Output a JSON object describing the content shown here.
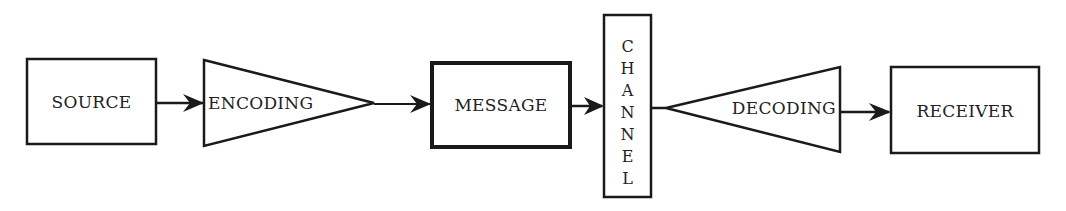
{
  "diagram": {
    "type": "communication-process-flow",
    "colors": {
      "background": "#ffffff",
      "line": "#1a1a1a",
      "text": "#222222"
    },
    "nodes": [
      {
        "id": "source",
        "label": "SOURCE",
        "shape": "rectangle"
      },
      {
        "id": "encoding",
        "label": "ENCODING",
        "shape": "triangle-right"
      },
      {
        "id": "message",
        "label": "MESSAGE",
        "shape": "rectangle-bold"
      },
      {
        "id": "channel",
        "label": "CHANNEL",
        "shape": "vertical-rectangle",
        "letters": [
          "C",
          "H",
          "A",
          "N",
          "N",
          "E",
          "L"
        ]
      },
      {
        "id": "decoding",
        "label": "DECODING",
        "shape": "triangle-left"
      },
      {
        "id": "receiver",
        "label": "RECEIVER",
        "shape": "rectangle"
      }
    ],
    "edges": [
      {
        "from": "source",
        "to": "encoding",
        "type": "arrow"
      },
      {
        "from": "encoding",
        "to": "message",
        "type": "arrow"
      },
      {
        "from": "message",
        "to": "channel",
        "type": "arrow"
      },
      {
        "from": "channel",
        "to": "decoding",
        "type": "line"
      },
      {
        "from": "decoding",
        "to": "receiver",
        "type": "arrow"
      }
    ]
  }
}
